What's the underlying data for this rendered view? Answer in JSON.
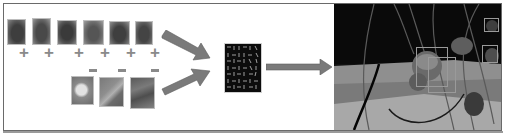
{
  "diagram": {
    "title": "Strawberry detection pipeline",
    "positive_samples": {
      "label": "positive training patches",
      "sign": "+",
      "count": 6,
      "items": [
        {
          "tone": "#5e5e5e",
          "inner": "#3e3e3e"
        },
        {
          "tone": "#6a6a6a",
          "inner": "#494949"
        },
        {
          "tone": "#565656",
          "inner": "#3a3a3a"
        },
        {
          "tone": "#6e6e6e",
          "inner": "#555555"
        },
        {
          "tone": "#626262",
          "inner": "#3f3f3f"
        },
        {
          "tone": "#606060",
          "inner": "#444444"
        }
      ]
    },
    "negative_samples": {
      "label": "negative training patches",
      "sign": "−",
      "count": 3,
      "items": [
        {
          "tone": "#7a7a7a",
          "inner": "#d8d8d8"
        },
        {
          "tone": "#6f6f6f",
          "inner": "#8a8a8a"
        },
        {
          "tone": "#5a5a5a",
          "inner": "#7a7a7a"
        }
      ]
    },
    "feature_block": {
      "label": "HOG feature visualization"
    },
    "result": {
      "label": "detection result",
      "detections": 4
    },
    "colors": {
      "arrow": "#7a7a7a",
      "border": "#6a6a6a",
      "sign": "#8a8a8a"
    }
  }
}
